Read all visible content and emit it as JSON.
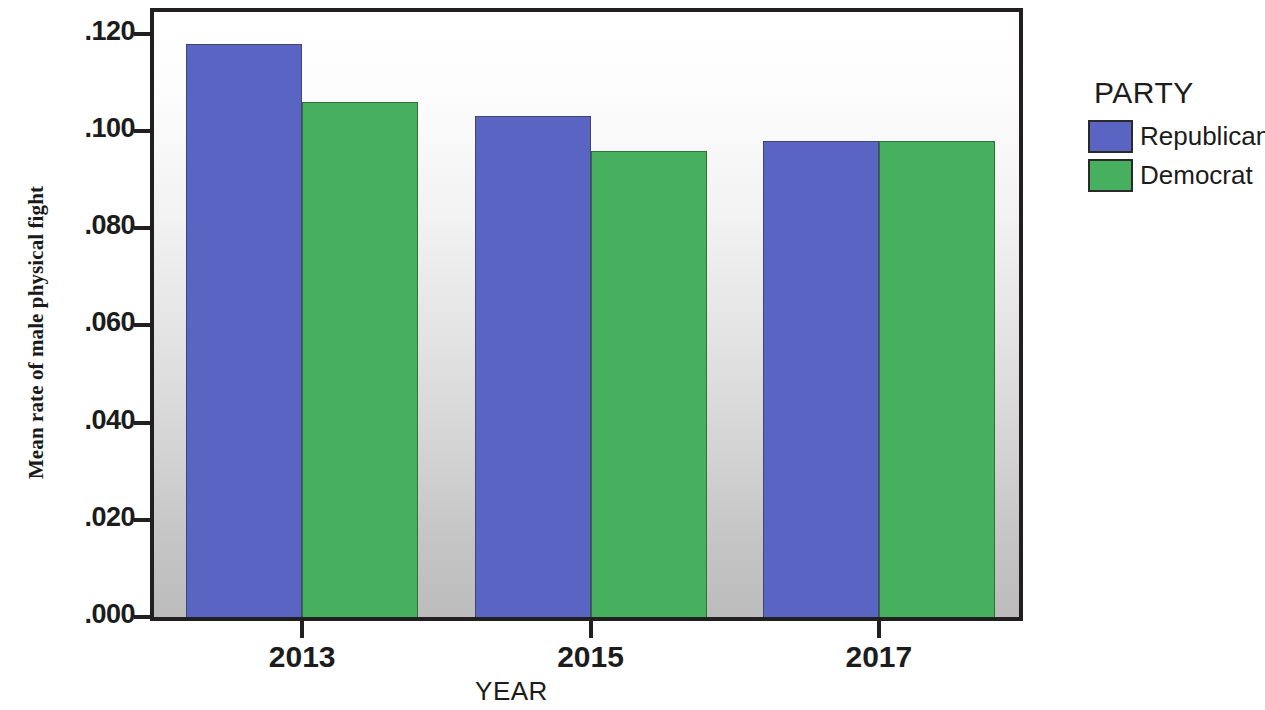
{
  "chart_data": {
    "type": "bar",
    "title": "",
    "xlabel": "YEAR",
    "ylabel": "Mean rate of male physical fight",
    "categories": [
      "2013",
      "2015",
      "2017"
    ],
    "series": [
      {
        "name": "Republican",
        "color": "#5a64c2",
        "values": [
          0.118,
          0.103,
          0.098
        ]
      },
      {
        "name": "Democrat",
        "color": "#46b05e",
        "values": [
          0.106,
          0.096,
          0.098
        ]
      }
    ],
    "ylim": [
      0.0,
      0.1245
    ],
    "ytick_values": [
      0.12,
      0.1,
      0.08,
      0.06,
      0.04,
      0.02,
      0.0
    ],
    "ytick_labels": [
      ".120",
      ".100",
      ".080",
      ".060",
      ".040",
      ".020",
      ".000"
    ],
    "xtick_labels": [
      "2013",
      "2015",
      "2017"
    ],
    "grid": false,
    "legend": {
      "title": "PARTY",
      "position": "right",
      "entries": [
        "Republican",
        "Democrat"
      ]
    },
    "plot_background": "vertical gradient white to gray",
    "annotations": []
  },
  "axes": {
    "y_title": "Mean rate of male physical fight",
    "x_title": "YEAR"
  },
  "legend": {
    "title": "PARTY",
    "items": [
      {
        "label": "Republican",
        "color": "#5a64c2"
      },
      {
        "label": "Democrat",
        "color": "#46b05e"
      }
    ]
  }
}
